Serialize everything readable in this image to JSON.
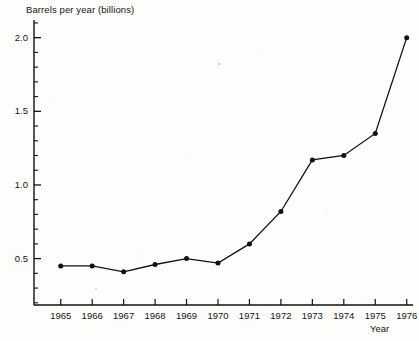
{
  "chart_data": {
    "type": "line",
    "title": "",
    "subtitle": "",
    "xlabel": "Year",
    "ylabel": "Barrels per year (billions)",
    "categories": [
      "1965",
      "1966",
      "1967",
      "1968",
      "1969",
      "1970",
      "1971",
      "1972",
      "1973",
      "1974",
      "1975",
      "1976"
    ],
    "x": [
      1965,
      1966,
      1967,
      1968,
      1969,
      1970,
      1971,
      1972,
      1973,
      1974,
      1975,
      1976
    ],
    "values": [
      0.45,
      0.45,
      0.41,
      0.46,
      0.5,
      0.47,
      0.6,
      0.82,
      1.17,
      1.2,
      1.35,
      2.0
    ],
    "series": [
      {
        "name": "Barrels per year (billions)",
        "values": [
          0.45,
          0.45,
          0.41,
          0.46,
          0.5,
          0.47,
          0.6,
          0.82,
          1.17,
          1.2,
          1.35,
          2.0
        ],
        "color": "#111111",
        "marker": "filled-circle",
        "line_width": 1.3
      }
    ],
    "ylim": [
      0.185,
      2.12
    ],
    "xlim": [
      1964.15,
      1976.2
    ],
    "ytick_values": [
      0.5,
      1.0,
      1.5,
      2.0
    ],
    "ytick_labels": [
      "0.5",
      "1.0",
      "1.5",
      "2.0"
    ],
    "yminor_step": 0.1,
    "xtick_labels": [
      "1965",
      "1966",
      "1967",
      "1968",
      "1969",
      "1970",
      "1971",
      "1972",
      "1973",
      "1974",
      "1975",
      "1976"
    ],
    "grid": false,
    "legend": null,
    "legend_position": "none",
    "axis_color": "#111111",
    "background_color": "#fdfdfc",
    "annotations": []
  },
  "axes": {
    "y_title": "Barrels per year (billions)",
    "x_title": "Year"
  }
}
